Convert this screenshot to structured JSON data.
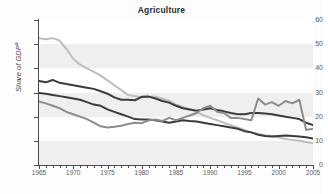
{
  "chart_data": {
    "type": "line",
    "title": "Agriculture",
    "xlabel": "",
    "ylabel": "Share of GDP",
    "ylabel_superscript": "a",
    "xlim": [
      1965,
      2005
    ],
    "ylim": [
      0,
      60
    ],
    "yticks": [
      0,
      10,
      20,
      30,
      40,
      50,
      60
    ],
    "xticks": [
      1965,
      1970,
      1975,
      1980,
      1985,
      1990,
      1995,
      2000,
      2005
    ],
    "x_minor_tick_interval": 1,
    "grid": "horizontal-banded",
    "legend": "none",
    "x": [
      1965,
      1966,
      1967,
      1968,
      1969,
      1970,
      1971,
      1972,
      1973,
      1974,
      1975,
      1976,
      1977,
      1978,
      1979,
      1980,
      1981,
      1982,
      1983,
      1984,
      1985,
      1986,
      1987,
      1988,
      1989,
      1990,
      1991,
      1992,
      1993,
      1994,
      1995,
      1996,
      1997,
      1998,
      1999,
      2000,
      2001,
      2002,
      2003,
      2004,
      2005
    ],
    "series": [
      {
        "name": "series-light-gray",
        "color": "#bdbdbd",
        "values": [
          52.5,
          52.0,
          52.5,
          51.5,
          48.0,
          44.0,
          41.5,
          40.0,
          38.5,
          37.0,
          35.0,
          33.0,
          31.0,
          29.0,
          28.5,
          28.0,
          28.2,
          28.3,
          27.5,
          26.5,
          25.0,
          24.0,
          23.0,
          22.0,
          20.5,
          19.5,
          18.5,
          17.5,
          16.5,
          15.5,
          14.5,
          13.5,
          12.8,
          12.3,
          12.0,
          11.4,
          10.8,
          10.4,
          10.0,
          9.5,
          9.0
        ]
      },
      {
        "name": "series-dark-upper",
        "color": "#3b3b3b",
        "values": [
          34.8,
          34.2,
          35.2,
          34.0,
          33.5,
          33.0,
          32.5,
          32.0,
          31.5,
          30.5,
          29.5,
          28.0,
          27.0,
          27.0,
          26.8,
          28.2,
          28.3,
          27.5,
          26.5,
          25.8,
          24.5,
          23.5,
          23.0,
          22.5,
          23.0,
          23.5,
          22.8,
          22.2,
          21.5,
          21.0,
          21.0,
          21.5,
          21.5,
          21.3,
          21.0,
          20.5,
          20.0,
          19.5,
          19.0,
          17.5,
          16.5
        ]
      },
      {
        "name": "series-dark-lower",
        "color": "#3b3b3b",
        "values": [
          29.8,
          29.5,
          29.0,
          28.5,
          28.0,
          27.5,
          27.0,
          26.0,
          25.0,
          24.5,
          23.0,
          22.0,
          21.0,
          20.0,
          19.0,
          18.8,
          18.8,
          18.5,
          18.0,
          17.5,
          18.0,
          18.5,
          18.2,
          18.0,
          17.5,
          17.0,
          16.5,
          16.0,
          15.5,
          15.0,
          14.0,
          13.5,
          12.5,
          12.0,
          11.8,
          12.0,
          12.2,
          12.0,
          11.8,
          11.5,
          11.0
        ]
      },
      {
        "name": "series-medium-gray",
        "color": "#8c8c8c",
        "values": [
          26.3,
          25.5,
          24.5,
          23.5,
          22.0,
          21.0,
          20.0,
          19.0,
          17.5,
          16.0,
          15.5,
          15.8,
          16.2,
          17.0,
          17.5,
          17.3,
          18.5,
          18.8,
          18.2,
          19.5,
          18.5,
          19.5,
          20.5,
          21.5,
          23.5,
          24.5,
          22.0,
          21.5,
          19.5,
          19.5,
          19.0,
          18.5,
          27.5,
          25.0,
          26.0,
          24.5,
          26.5,
          25.5,
          27.0,
          14.5,
          15.0
        ]
      }
    ]
  }
}
